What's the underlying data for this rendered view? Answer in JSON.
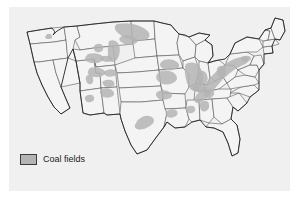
{
  "figure": {
    "kind": "thematic-map",
    "background_color": "#f0f0f0",
    "page_color": "#ffffff"
  },
  "legend": {
    "label": "Coal fields",
    "swatch_fill": "#b4b4b4",
    "swatch_border": "#3b3b3b"
  },
  "map": {
    "state_fill": "#f4f4f4",
    "state_stroke": "#4a4a4a",
    "outline_stroke": "#222222",
    "coal_fill": "#b4b4b4",
    "regions": [
      {
        "name": "powder-river-basin",
        "states": "Montana / Wyoming"
      },
      {
        "name": "fort-union-lignite",
        "states": "North Dakota / Montana"
      },
      {
        "name": "green-river-basin",
        "states": "Wyoming"
      },
      {
        "name": "uinta-basin",
        "states": "Utah / Colorado"
      },
      {
        "name": "san-juan-basin",
        "states": "New Mexico / Colorado"
      },
      {
        "name": "raton-basin",
        "states": "Colorado / New Mexico"
      },
      {
        "name": "black-mesa",
        "states": "Arizona"
      },
      {
        "name": "illinois-basin",
        "states": "Illinois / Indiana / Kentucky"
      },
      {
        "name": "western-interior",
        "states": "Iowa / Missouri / Kansas / Oklahoma"
      },
      {
        "name": "appalachian-basin",
        "states": "Pennsylvania / West Virginia / Kentucky / Virginia"
      },
      {
        "name": "anthracite-field",
        "states": "Pennsylvania"
      },
      {
        "name": "gulf-coast-lignite",
        "states": "Texas / Louisiana / Mississippi / Alabama"
      },
      {
        "name": "black-warrior-basin",
        "states": "Alabama"
      },
      {
        "name": "pacific-northwest",
        "states": "Washington"
      }
    ]
  }
}
